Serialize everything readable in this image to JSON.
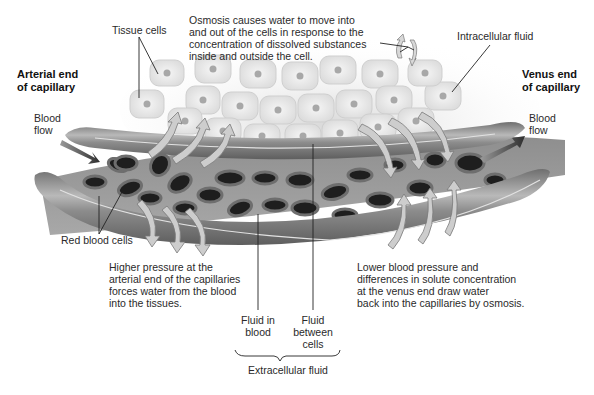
{
  "diagram": {
    "labels": {
      "tissue_cells": "Tissue cells",
      "osmosis_note": [
        "Osmosis causes water to move into",
        "and out of the cells in response to the",
        "concentration of dissolved substances",
        "inside and outside the cell."
      ],
      "intracellular_fluid": "Intracellular fluid",
      "arterial_end": [
        "Arterial end",
        "of capillary"
      ],
      "venus_end": [
        "Venus end",
        "of capillary"
      ],
      "blood_flow_left": [
        "Blood",
        "flow"
      ],
      "blood_flow_right": [
        "Blood",
        "flow"
      ],
      "red_blood_cells": "Red blood cells",
      "higher_pressure_note": [
        "Higher pressure at the",
        "arterial end of the capillaries",
        "forces water from the blood",
        "into the tissues."
      ],
      "lower_pressure_note": [
        "Lower blood pressure and",
        "differences in solute concentration",
        "at the venus end draw water",
        "back into the capillaries by osmosis."
      ],
      "fluid_in_blood": [
        "Fluid in",
        "blood"
      ],
      "fluid_between_cells": [
        "Fluid",
        "between",
        "cells"
      ],
      "extracellular_fluid": "Extracellular fluid"
    },
    "colors": {
      "vessel_wall": "#8a8a8a",
      "vessel_highlight": "#cfcfcf",
      "vessel_interior": "#9c9c9c",
      "rbc_rim": "#6e6e6e",
      "rbc_center": "#1e1e1e",
      "tissue_cell": "#ececec",
      "tissue_nucleus": "#a8a8a8",
      "arrow_fill": "#c8c8c8",
      "flow_arrow": "#4a4a4a"
    }
  }
}
